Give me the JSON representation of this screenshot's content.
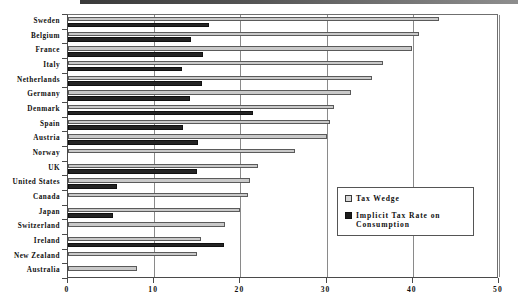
{
  "chart_data": {
    "type": "bar",
    "orientation": "horizontal",
    "title": "",
    "xlabel": "",
    "ylabel": "",
    "xlim": [
      0,
      50
    ],
    "xticks": [
      0,
      10,
      20,
      30,
      40,
      50
    ],
    "grid": true,
    "legend_position": "inside-right",
    "categories": [
      "Sweden",
      "Belgium",
      "France",
      "Italy",
      "Netherlands",
      "Germany",
      "Denmark",
      "Spain",
      "Austria",
      "Norway",
      "UK",
      "United States",
      "Canada",
      "Japan",
      "Switzerland",
      "Ireland",
      "New Zealand",
      "Australia"
    ],
    "series": [
      {
        "name": "Tax Wedge",
        "color": "#c9c9c9",
        "values": [
          43.0,
          40.7,
          39.9,
          36.5,
          35.3,
          32.8,
          30.9,
          30.4,
          30.1,
          26.3,
          22.0,
          21.1,
          20.9,
          20.0,
          18.2,
          15.4,
          15.0,
          8.0
        ]
      },
      {
        "name": "Implicit Tax Rate on Consumption",
        "color": "#242424",
        "values": [
          16.3,
          14.3,
          15.7,
          13.2,
          15.5,
          14.2,
          21.5,
          13.3,
          15.1,
          null,
          15.0,
          5.7,
          null,
          5.2,
          null,
          18.1,
          null,
          null
        ]
      }
    ]
  },
  "axis": {
    "x_tick_labels": [
      "0",
      "10",
      "20",
      "30",
      "40",
      "50"
    ]
  },
  "legend": {
    "items": [
      {
        "label": "Tax Wedge",
        "swatch": "light"
      },
      {
        "label": "Implicit Tax Rate on Consumption",
        "swatch": "dark"
      }
    ]
  }
}
